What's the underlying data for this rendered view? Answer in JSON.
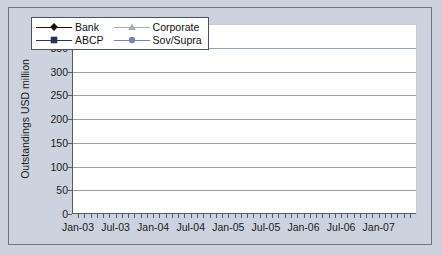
{
  "chart_data": {
    "type": "line",
    "title": "",
    "xlabel": "",
    "ylabel": "Outstandings USD million",
    "ylim": [
      0,
      400
    ],
    "ytick_step": 50,
    "yticks": [
      "0",
      "50",
      "100",
      "150",
      "200",
      "250",
      "300",
      "350",
      "400"
    ],
    "grid": true,
    "legend_position": "top-left inside plot",
    "legend_order": [
      "Bank",
      "Corporate",
      "ABCP",
      "Sov/Supra"
    ],
    "x": [
      "Jan-03",
      "Feb-03",
      "Mar-03",
      "Apr-03",
      "May-03",
      "Jun-03",
      "Jul-03",
      "Aug-03",
      "Sep-03",
      "Oct-03",
      "Nov-03",
      "Dec-03",
      "Jan-04",
      "Feb-04",
      "Mar-04",
      "Apr-04",
      "May-04",
      "Jun-04",
      "Jul-04",
      "Aug-04",
      "Sep-04",
      "Oct-04",
      "Nov-04",
      "Dec-04",
      "Jan-05",
      "Feb-05",
      "Mar-05",
      "Apr-05",
      "May-05",
      "Jun-05",
      "Jul-05",
      "Aug-05",
      "Sep-05",
      "Oct-05",
      "Nov-05",
      "Dec-05",
      "Jan-06",
      "Feb-06",
      "Mar-06",
      "Apr-06",
      "May-06",
      "Jun-06",
      "Jul-06",
      "Aug-06",
      "Sep-06",
      "Oct-06",
      "Nov-06",
      "Dec-06",
      "Jan-07",
      "Feb-07",
      "Mar-07",
      "Apr-07",
      "May-07",
      "Jun-07"
    ],
    "xtick_labels": [
      "Jan-03",
      "Jul-03",
      "Jan-04",
      "Jul-04",
      "Jan-05",
      "Jul-05",
      "Jan-06",
      "Jul-06",
      "Jan-07"
    ],
    "xtick_label_indices": [
      0,
      6,
      12,
      18,
      24,
      30,
      36,
      42,
      48
    ],
    "series": [
      {
        "name": "Bank",
        "color": "#111111",
        "marker": "diamond",
        "values": [
          174,
          186,
          186,
          182,
          184,
          191,
          196,
          183,
          189,
          202,
          212,
          216,
          229,
          220,
          229,
          231,
          221,
          220,
          235,
          230,
          232,
          239,
          246,
          253,
          255,
          246,
          257,
          262,
          268,
          265,
          263,
          261,
          262,
          261,
          254,
          234,
          234,
          240,
          243,
          258,
          265,
          274,
          270,
          267,
          263,
          270,
          283,
          301,
          299,
          321,
          334,
          344,
          350,
          350
        ]
      },
      {
        "name": "ABCP",
        "color": "#2b3159",
        "marker": "square",
        "values": [
          62,
          64,
          68,
          68,
          73,
          77,
          78,
          78,
          78,
          82,
          86,
          88,
          92,
          95,
          100,
          101,
          100,
          100,
          97,
          98,
          100,
          106,
          114,
          116,
          122,
          126,
          133,
          138,
          142,
          147,
          153,
          154,
          153,
          153,
          147,
          146,
          139,
          142,
          156,
          153,
          158,
          166,
          181,
          183,
          183,
          192,
          200,
          209,
          217,
          218,
          229,
          239,
          249,
          266
        ]
      },
      {
        "name": "Corporate",
        "color": "#a7acb4",
        "marker": "triangle",
        "values": [
          68,
          70,
          69,
          70,
          74,
          76,
          76,
          75,
          75,
          76,
          74,
          72,
          71,
          70,
          68,
          68,
          67,
          62,
          67,
          73,
          71,
          71,
          70,
          70,
          67,
          68,
          67,
          67,
          67,
          69,
          73,
          69,
          66,
          68,
          68,
          59,
          50,
          54,
          62,
          59,
          61,
          58,
          67,
          67,
          62,
          65,
          61,
          64,
          56,
          53,
          58,
          63,
          66,
          70
        ]
      },
      {
        "name": "Sov/Supra",
        "color": "#7a86ad",
        "marker": "circle",
        "values": [
          43,
          48,
          51,
          52,
          52,
          51,
          50,
          48,
          46,
          45,
          45,
          46,
          45,
          44,
          37,
          42,
          45,
          48,
          51,
          55,
          59,
          62,
          58,
          63,
          66,
          66,
          67,
          67,
          66,
          66,
          72,
          62,
          57,
          48,
          47,
          47,
          46,
          44,
          45,
          42,
          48,
          44,
          52,
          47,
          47,
          47,
          49,
          48,
          51,
          45,
          47,
          50,
          51,
          55
        ]
      }
    ]
  }
}
